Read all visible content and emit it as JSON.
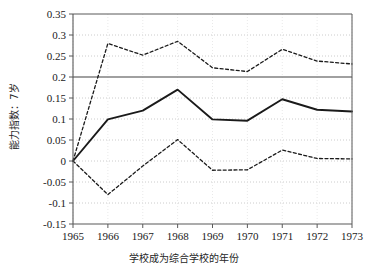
{
  "chart_data": {
    "type": "line",
    "title": "",
    "xlabel": "学校成为综合学校的年份",
    "ylabel": "能力指数：7岁",
    "x": [
      1965,
      1966,
      1967,
      1968,
      1969,
      1970,
      1971,
      1972,
      1973
    ],
    "xtick_labels": [
      "1965",
      "1966",
      "1967",
      "1968",
      "1969",
      "1970",
      "1971",
      "1972",
      "1973"
    ],
    "ytick_labels": [
      "0.35",
      "0.3",
      "0.25",
      "0.2",
      "0.15",
      "0.1",
      "0.05",
      "0",
      "-0.05",
      "-0.1",
      "-0.15"
    ],
    "ytick_values": [
      0.35,
      0.3,
      0.25,
      0.2,
      0.15,
      0.1,
      0.05,
      0,
      -0.05,
      -0.1,
      -0.15
    ],
    "ylim": [
      -0.15,
      0.35
    ],
    "xlim": [
      1965,
      1973
    ],
    "grid": true,
    "legend": "none",
    "series": [
      {
        "name": "upper-confidence-bound",
        "style": "dashed",
        "color": "#1a1a1a",
        "values": [
          0.0,
          0.28,
          0.252,
          0.285,
          0.222,
          0.213,
          0.266,
          0.238,
          0.231
        ]
      },
      {
        "name": "point-estimate",
        "style": "solid",
        "color": "#1a1a1a",
        "values": [
          0.0,
          0.099,
          0.12,
          0.17,
          0.099,
          0.096,
          0.147,
          0.122,
          0.118
        ]
      },
      {
        "name": "lower-confidence-bound",
        "style": "dashed",
        "color": "#1a1a1a",
        "values": [
          0.0,
          -0.08,
          -0.012,
          0.051,
          -0.022,
          -0.021,
          0.026,
          0.006,
          0.005
        ]
      }
    ],
    "reference_line": {
      "name": "horizontal-reference-line",
      "y": 0.2,
      "color": "#808080"
    },
    "colors": {
      "axis": "#595959",
      "grid": "#bfbfbf",
      "line": "#1a1a1a",
      "reference": "#808080",
      "background": "#ffffff"
    }
  }
}
